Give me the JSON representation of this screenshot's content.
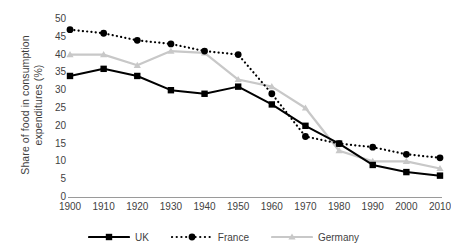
{
  "chart_data": {
    "type": "line",
    "title": "",
    "xlabel": "",
    "ylabel": "Share of food in consumption expenditures (%)",
    "ylabel_line1": "Share of food in consumption",
    "ylabel_line2": "expenditures (%)",
    "categories": [
      "1900",
      "1910",
      "1920",
      "1930",
      "1940",
      "1950",
      "1960",
      "1970",
      "1980",
      "1990",
      "2000",
      "2010"
    ],
    "x": [
      1900,
      1910,
      1920,
      1930,
      1940,
      1950,
      1960,
      1970,
      1980,
      1990,
      2000,
      2010
    ],
    "ylim": [
      0,
      50
    ],
    "yticks": [
      0,
      5,
      10,
      15,
      20,
      25,
      30,
      35,
      40,
      45,
      50
    ],
    "grid": false,
    "legend_position": "bottom",
    "series": [
      {
        "name": "UK",
        "color": "#000000",
        "linestyle": "solid",
        "marker": "square",
        "values": [
          34,
          36,
          34,
          30,
          29,
          31,
          26,
          20,
          15,
          9,
          7,
          6
        ]
      },
      {
        "name": "France",
        "color": "#000000",
        "linestyle": "dotted",
        "marker": "circle",
        "values": [
          47,
          46,
          44,
          43,
          41,
          40,
          29,
          17,
          15,
          14,
          12,
          11
        ]
      },
      {
        "name": "Germany",
        "color": "#c8c8c8",
        "linestyle": "solid",
        "marker": "triangle",
        "values": [
          40,
          40,
          37,
          41,
          40.5,
          33,
          31,
          25,
          13,
          10,
          10,
          8
        ]
      }
    ]
  },
  "legend": {
    "items": [
      {
        "label": "UK"
      },
      {
        "label": "France"
      },
      {
        "label": "Germany"
      }
    ]
  },
  "colors": {
    "uk": "#000000",
    "france": "#000000",
    "germany": "#c8c8c8",
    "axis": "#9a9a9a",
    "text": "#3f3f3f"
  }
}
